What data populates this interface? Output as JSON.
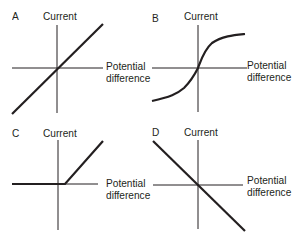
{
  "panels": [
    {
      "letter": "A",
      "y_label": "Current",
      "x_label_1": "Potential",
      "x_label_2": "difference",
      "shape": "straight line through origin, positive slope"
    },
    {
      "letter": "B",
      "y_label": "Current",
      "x_label_1": "Potential",
      "x_label_2": "difference",
      "shape": "S-shaped curve through origin"
    },
    {
      "letter": "C",
      "y_label": "Current",
      "x_label_1": "Potential",
      "x_label_2": "difference",
      "shape": "zero current until threshold, then linear rise"
    },
    {
      "letter": "D",
      "y_label": "Current",
      "x_label_1": "Potential",
      "x_label_2": "difference",
      "shape": "straight line through origin, negative slope"
    }
  ],
  "colors": {
    "line": "#231f20",
    "axis": "#231f20",
    "background": "#ffffff"
  }
}
